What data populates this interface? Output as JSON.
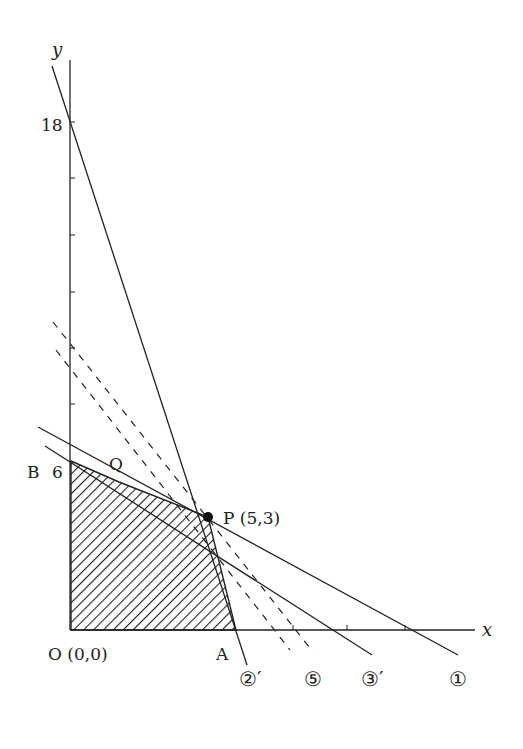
{
  "diagram": {
    "type": "linear-programming-feasible-region",
    "axes": {
      "x_label": "x",
      "y_label": "y",
      "y_tick_label_top": "18",
      "y_tick_label_b": "6"
    },
    "points": {
      "origin": "O (0,0)",
      "A": "A",
      "B": "B",
      "Q": "Q",
      "P": "P (5,3)"
    },
    "line_labels": {
      "line_2prime": "②′",
      "line_5": "⑤",
      "line_3prime": "③′",
      "line_1": "①"
    },
    "colors": {
      "ink": "#222222",
      "background": "#ffffff"
    }
  }
}
